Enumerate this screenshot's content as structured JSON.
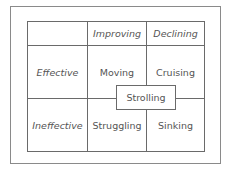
{
  "diagram": {
    "type": "2x2 matrix",
    "column_headers": [
      "Improving",
      "Declining"
    ],
    "row_headers": [
      "Effective",
      "Ineffective"
    ],
    "cells": [
      [
        "Moving",
        "Cruising"
      ],
      [
        "Struggling",
        "Sinking"
      ]
    ],
    "center_label": "Strolling",
    "colors": {
      "line": "#6a6a6a",
      "outer_border": "#8a8a8a",
      "text": "#555555",
      "background": "#ffffff"
    }
  }
}
